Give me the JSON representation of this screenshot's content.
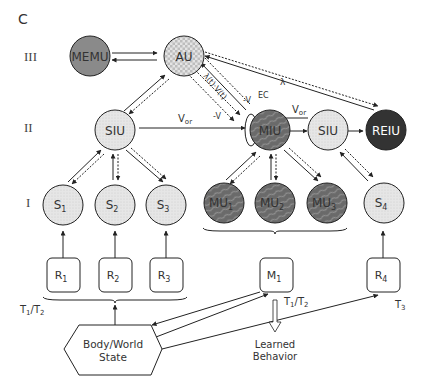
{
  "panel_label": "C",
  "levels": {
    "III": "III",
    "II": "II",
    "I": "I"
  },
  "nodes": {
    "memu": {
      "label": "MEMU",
      "fill": "#8a8a8a"
    },
    "au": {
      "label": "AU",
      "fill": "#d9d9d9"
    },
    "siu_left": {
      "label": "SIU",
      "fill": "#dcdcdc"
    },
    "miu": {
      "label": "MIU",
      "fill": "#6e6e6e"
    },
    "siu_right": {
      "label": "SIU",
      "fill": "#e6e6e6"
    },
    "reiu": {
      "label": "REIU",
      "fill": "#333333"
    },
    "s1": {
      "label": "S",
      "sub": "1"
    },
    "s2": {
      "label": "S",
      "sub": "2"
    },
    "s3": {
      "label": "S",
      "sub": "3"
    },
    "mu1": {
      "label": "MU",
      "sub": "1"
    },
    "mu2": {
      "label": "MU",
      "sub": "2"
    },
    "mu3": {
      "label": "MU",
      "sub": "3"
    },
    "s4": {
      "label": "S",
      "sub": "4"
    },
    "r1": {
      "label": "R",
      "sub": "1"
    },
    "r2": {
      "label": "R",
      "sub": "2"
    },
    "r3": {
      "label": "R",
      "sub": "3"
    },
    "m1": {
      "label": "M",
      "sub": "1"
    },
    "r4": {
      "label": "R",
      "sub": "4"
    },
    "body": {
      "line1": "Body/World",
      "line2": "State"
    }
  },
  "edge_labels": {
    "vor_left": {
      "main": "V",
      "sub": "or"
    },
    "vor_right": {
      "main": "V",
      "sub": "or"
    },
    "lambda_reiu": "λ",
    "lambda_v": "λ(t)·V(t)",
    "neg_v_lower": "-V",
    "v_upper": "-V",
    "ec": "EC"
  },
  "timing_labels": {
    "t1t2_left": {
      "a": "T",
      "a_sub": "1",
      "sep": "/",
      "b": "T",
      "b_sub": "2"
    },
    "t1t2_mid": {
      "a": "T",
      "a_sub": "1",
      "sep": "/",
      "b": "T",
      "b_sub": "2"
    },
    "t3": {
      "a": "T",
      "a_sub": "3"
    }
  },
  "output_label": {
    "line1": "Learned",
    "line2": "Behavior"
  }
}
